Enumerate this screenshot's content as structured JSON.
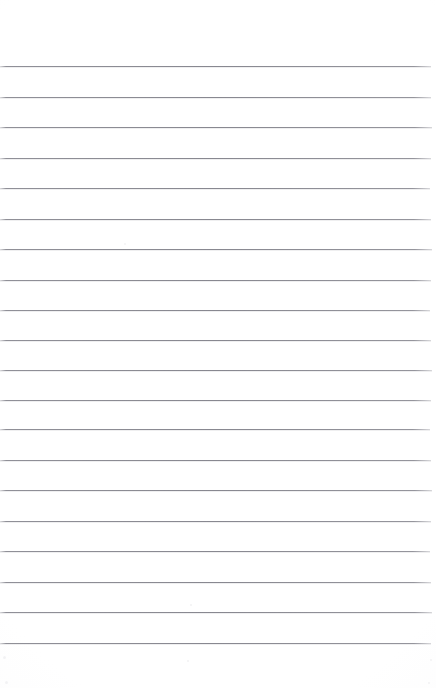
{
  "document": {
    "kind": "scanned-lined-paper",
    "title": "Blank ruled notebook page",
    "page_width": 436,
    "page_height": 688,
    "background_color": "#fdfdfd",
    "rule_color": "#8a8a90",
    "rule_thickness": 1,
    "top_margin": 66,
    "bottom_margin": 45,
    "left_inset": 0,
    "right_inset": 5,
    "line_spacing": 30.4,
    "line_count": 20,
    "written_text": "",
    "margin_rule": "none",
    "header_text": "",
    "footer_text": ""
  },
  "rules": {
    "y_positions": [
      66,
      96.5,
      127,
      157.5,
      188,
      218.5,
      249,
      279.5,
      310,
      340,
      370,
      399.5,
      429,
      459.5,
      490,
      520.5,
      551,
      581.5,
      612,
      643
    ],
    "widths": [
      431,
      431,
      432,
      431,
      430,
      431,
      432,
      431,
      430,
      431,
      432,
      431,
      430,
      431,
      432,
      431,
      430,
      431,
      432,
      431
    ]
  },
  "specks": [
    {
      "x": 3,
      "y": 656,
      "size": 3
    },
    {
      "x": 187,
      "y": 660,
      "size": 2
    },
    {
      "x": 430,
      "y": 659,
      "size": 2
    },
    {
      "x": 5,
      "y": 681,
      "size": 3
    },
    {
      "x": 428,
      "y": 682,
      "size": 2
    },
    {
      "x": 124,
      "y": 243,
      "size": 2
    },
    {
      "x": 190,
      "y": 604,
      "size": 2
    }
  ]
}
